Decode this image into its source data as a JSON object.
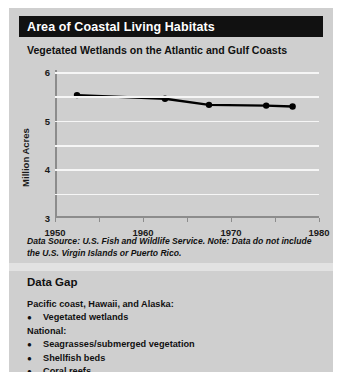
{
  "header": {
    "title": "Area of Coastal Living Habitats",
    "subtitle": "Vegetated Wetlands on the Atlantic and Gulf Coasts"
  },
  "footnote": "Data Source: U.S. Fish and Wildlife Service. Note: Data do not include the U.S. Virgin Islands or Puerto Rico.",
  "data_gap": {
    "title": "Data Gap",
    "groups": [
      {
        "label": "Pacific coast, Hawaii, and Alaska:",
        "items": [
          "Vegetated wetlands"
        ]
      },
      {
        "label": "National:",
        "items": [
          "Seagrasses/submerged vegetation",
          "Shellfish beds",
          "Coral reefs"
        ]
      }
    ]
  },
  "colors": {
    "header_bar": "#111111",
    "panel_background": "#cfcfcf",
    "gridline": "#f6f6f6",
    "axis": "#8c8c8c",
    "series": "#000000"
  },
  "chart_data": {
    "type": "line",
    "title": "Vegetated Wetlands on the Atlantic and Gulf Coasts",
    "xlabel": "",
    "ylabel": "Million Acres",
    "xlim": [
      1950,
      2010
    ],
    "ylim": [
      0,
      6
    ],
    "xticks": [
      1950,
      1960,
      1970,
      1980,
      1990,
      2000,
      2010
    ],
    "yticks": [
      0,
      1,
      2,
      3,
      4,
      5,
      6
    ],
    "grid": true,
    "legend": "none",
    "series": [
      {
        "name": "Vegetated wetlands",
        "x": [
          1955,
          1975,
          1985,
          1998,
          2004
        ],
        "values": [
          5.05,
          4.9,
          4.65,
          4.62,
          4.58
        ]
      }
    ]
  }
}
